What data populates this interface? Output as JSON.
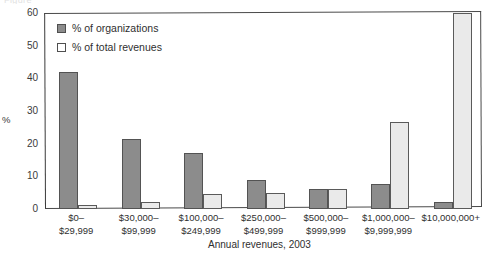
{
  "figure": {
    "caption_fragment": "Figure",
    "xaxis_title": "Annual revenues, 2003",
    "yaxis_title": "%"
  },
  "legend": {
    "position": "top-left-inside",
    "items": [
      {
        "label": "% of organizations",
        "swatch": "dark-filled-square",
        "color": "#8c8c8c"
      },
      {
        "label": "% of total revenues",
        "swatch": "open-square",
        "color": "#ffffff"
      }
    ]
  },
  "yticks": [
    "0",
    "10",
    "20",
    "30",
    "40",
    "50",
    "60"
  ],
  "chart_data": {
    "type": "bar",
    "title": "",
    "subtitle": "",
    "xlabel": "Annual revenues, 2003",
    "ylabel": "%",
    "ylim": [
      0,
      60
    ],
    "yticks": [
      0,
      10,
      20,
      30,
      40,
      50,
      60
    ],
    "grid": false,
    "legend_position": "top-left-inside",
    "categories": [
      "$0-\n$29,999",
      "$30,000-\n$99,999",
      "$100,000-\n$249,999",
      "$250,000-\n$499,999",
      "$500,000-\n$999,999",
      "$1,000,000-\n$9,999,999",
      "$10,000,000+"
    ],
    "category_lines": [
      [
        "$0–",
        "$29,999"
      ],
      [
        "$30,000–",
        "$99,999"
      ],
      [
        "$100,000–",
        "$249,999"
      ],
      [
        "$250,000–",
        "$499,999"
      ],
      [
        "$500,000–",
        "$999,999"
      ],
      [
        "$1,000,000–",
        "$9,999,999"
      ],
      [
        "$10,000,000+",
        ""
      ]
    ],
    "series": [
      {
        "name": "% of organizations",
        "color": "#8c8c8c",
        "values": [
          42.0,
          21.3,
          17.0,
          9.0,
          6.0,
          7.8,
          2.2
        ]
      },
      {
        "name": "% of total revenues",
        "color": "#eaeaea",
        "values": [
          1.2,
          2.3,
          4.6,
          5.0,
          6.1,
          26.5,
          60.0
        ]
      }
    ]
  }
}
